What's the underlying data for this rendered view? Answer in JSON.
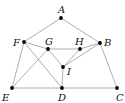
{
  "diagram": {
    "type": "graph",
    "points": {
      "A": {
        "x": 61,
        "y": 18,
        "label": "A",
        "lx": 58,
        "ly": 13
      },
      "B": {
        "x": 100,
        "y": 43,
        "label": "B",
        "lx": 104,
        "ly": 46
      },
      "C": {
        "x": 117,
        "y": 88,
        "label": "C",
        "lx": 116,
        "ly": 101
      },
      "D": {
        "x": 62,
        "y": 88,
        "label": "D",
        "lx": 58,
        "ly": 101
      },
      "E": {
        "x": 12,
        "y": 88,
        "label": "E",
        "lx": 2,
        "ly": 101
      },
      "F": {
        "x": 24,
        "y": 42,
        "label": "F",
        "lx": 13,
        "ly": 46
      },
      "G": {
        "x": 48,
        "y": 49,
        "label": "G",
        "lx": 45,
        "ly": 45
      },
      "H": {
        "x": 80,
        "y": 49,
        "label": "H",
        "lx": 75,
        "ly": 45
      },
      "I": {
        "x": 63,
        "y": 67,
        "label": "I",
        "lx": 67,
        "ly": 75
      }
    },
    "edges": [
      [
        "A",
        "F"
      ],
      [
        "A",
        "B"
      ],
      [
        "F",
        "E"
      ],
      [
        "F",
        "G"
      ],
      [
        "F",
        "D"
      ],
      [
        "G",
        "H"
      ],
      [
        "H",
        "B"
      ],
      [
        "G",
        "I"
      ],
      [
        "I",
        "H"
      ],
      [
        "I",
        "B"
      ],
      [
        "I",
        "D"
      ],
      [
        "E",
        "G"
      ],
      [
        "E",
        "D"
      ],
      [
        "D",
        "C"
      ],
      [
        "B",
        "C"
      ]
    ]
  }
}
